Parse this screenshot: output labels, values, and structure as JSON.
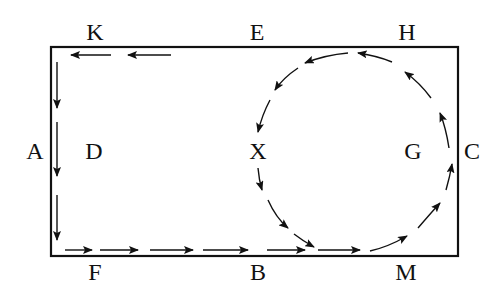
{
  "labels": {
    "K": "K",
    "E": "E",
    "H": "H",
    "A": "A",
    "D": "D",
    "X": "X",
    "G": "G",
    "C": "C",
    "F": "F",
    "B": "B",
    "M": "M"
  },
  "colors": {
    "stroke": "#111111",
    "background": "#ffffff"
  }
}
